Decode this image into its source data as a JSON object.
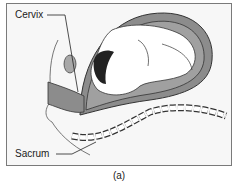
{
  "diagram": {
    "labels": {
      "cervix": "Cervix",
      "sacrum": "Sacrum"
    },
    "caption": "(a)",
    "colors": {
      "uterus_fill": "#8c8c8c",
      "fluid_fill": "#a0a0a0",
      "body_fill": "#ffffff",
      "outline": "#333333",
      "background": "#f7f7f7",
      "frame_border": "#7a7a7a"
    }
  }
}
